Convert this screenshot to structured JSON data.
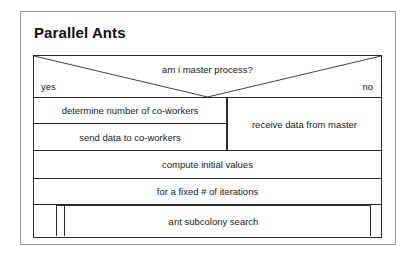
{
  "document": {
    "title": "Parallel Ants"
  },
  "diagram": {
    "type": "nassi-shneiderman-structogram",
    "decision": {
      "condition": "am i master process?",
      "true_label": "yes",
      "false_label": "no"
    },
    "branches": {
      "left": [
        "determine number of co-workers",
        "send data to co-workers"
      ],
      "right": [
        "receive data from master"
      ]
    },
    "sequence": [
      "compute initial values"
    ],
    "loop": {
      "header": "for a fixed # of iterations",
      "body": "ant subcolony search"
    }
  },
  "colors": {
    "line": "#2b2b2b",
    "frame": "#9a9a9a",
    "text": "#1a1a1a",
    "background": "#ffffff"
  }
}
